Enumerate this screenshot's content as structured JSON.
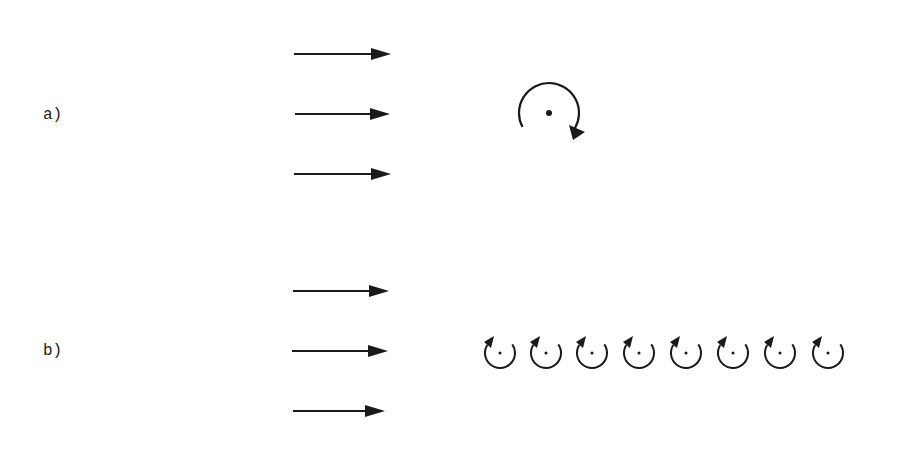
{
  "panels": [
    {
      "label": "a)",
      "description": "uniform flow with a single large vortex",
      "flow_arrows": [
        {
          "x1": 294,
          "y": 54,
          "x2": 391
        },
        {
          "x1": 295,
          "y": 114,
          "x2": 390
        },
        {
          "x1": 294,
          "y": 174,
          "x2": 391
        }
      ],
      "vortices": [
        {
          "cx": 549,
          "cy": 113,
          "r": 30,
          "rotation": "clockwise",
          "size": "large"
        }
      ]
    },
    {
      "label": "b)",
      "description": "uniform flow with a row of small vortices",
      "flow_arrows": [
        {
          "x1": 293,
          "y": 291,
          "x2": 389
        },
        {
          "x1": 292,
          "y": 351,
          "x2": 388
        },
        {
          "x1": 293,
          "y": 411,
          "x2": 385
        }
      ],
      "vortices": [
        {
          "cx": 500,
          "cy": 353,
          "r": 15,
          "rotation": "counterclockwise",
          "size": "small"
        },
        {
          "cx": 546,
          "cy": 353,
          "r": 15,
          "rotation": "counterclockwise",
          "size": "small"
        },
        {
          "cx": 592,
          "cy": 353,
          "r": 15,
          "rotation": "counterclockwise",
          "size": "small"
        },
        {
          "cx": 639,
          "cy": 353,
          "r": 15,
          "rotation": "counterclockwise",
          "size": "small"
        },
        {
          "cx": 686,
          "cy": 353,
          "r": 15,
          "rotation": "counterclockwise",
          "size": "small"
        },
        {
          "cx": 733,
          "cy": 353,
          "r": 15,
          "rotation": "counterclockwise",
          "size": "small"
        },
        {
          "cx": 780,
          "cy": 353,
          "r": 15,
          "rotation": "counterclockwise",
          "size": "small"
        },
        {
          "cx": 828,
          "cy": 353,
          "r": 15,
          "rotation": "counterclockwise",
          "size": "small"
        }
      ]
    }
  ],
  "colors": {
    "ink": "#1a1a1a",
    "background": "#ffffff"
  }
}
